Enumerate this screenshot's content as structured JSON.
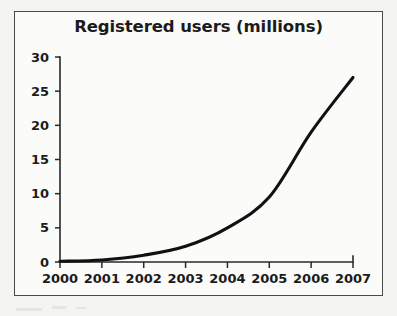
{
  "figure": {
    "title": "Registered users (millions)",
    "frame_color": "#4a4a4a",
    "background_color": "#f4f4f2",
    "plot_background_color": "#fbfbfa"
  },
  "chart_data": {
    "type": "line",
    "title": "Registered users (millions)",
    "xlabel": "",
    "ylabel": "",
    "x": [
      2000,
      2001,
      2002,
      2003,
      2004,
      2005,
      2006,
      2007
    ],
    "categories": [
      "2000",
      "2001",
      "2002",
      "2003",
      "2004",
      "2005",
      "2006",
      "2007"
    ],
    "values": [
      0.1,
      0.3,
      1.0,
      2.3,
      5.0,
      9.5,
      19.0,
      27.0
    ],
    "series": [
      {
        "name": "Registered users",
        "values": [
          0.1,
          0.3,
          1.0,
          2.3,
          5.0,
          9.5,
          19.0,
          27.0
        ],
        "color": "#111111"
      }
    ],
    "xlim": [
      2000,
      2007
    ],
    "ylim": [
      0,
      30
    ],
    "y_ticks": [
      0,
      5,
      10,
      15,
      20,
      25,
      30
    ],
    "y_tick_labels": [
      "0",
      "5",
      "10",
      "15",
      "20",
      "25",
      "30"
    ],
    "x_ticks": [
      2000,
      2001,
      2002,
      2003,
      2004,
      2005,
      2006,
      2007
    ],
    "x_tick_labels": [
      "2000",
      "2001",
      "2002",
      "2003",
      "2004",
      "2005",
      "2006",
      "2007"
    ],
    "grid": false,
    "legend": false,
    "legend_position": "none",
    "line_color": "#111111"
  }
}
